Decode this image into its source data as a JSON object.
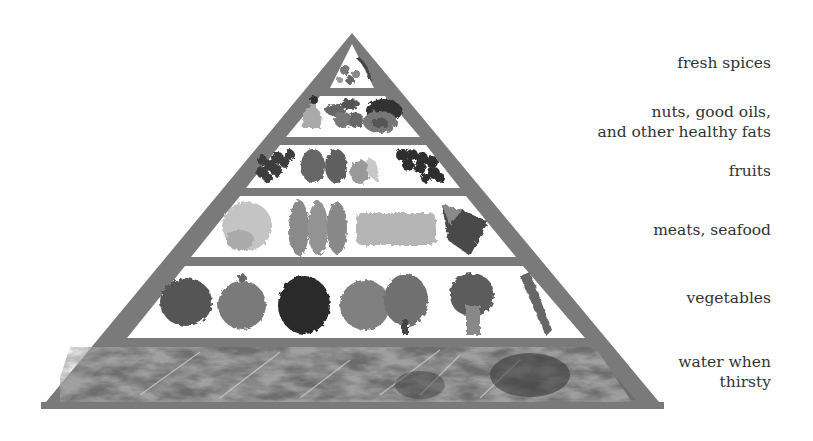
{
  "diagram": {
    "type": "food-pyramid",
    "colors": {
      "frame": "#777777",
      "tier_bg": "#ffffff",
      "text": "#333333"
    },
    "tiers": [
      {
        "level": 1,
        "label": "fresh spices",
        "items": [
          "herbs",
          "spices",
          "chili peppers"
        ]
      },
      {
        "level": 2,
        "label": "nuts, good oils, and other healthy fats",
        "label_lines": [
          "nuts, good oils,",
          "and other healthy fats"
        ],
        "items": [
          "oil bottle",
          "nuts",
          "avocado"
        ]
      },
      {
        "level": 3,
        "label": "fruits",
        "items": [
          "grapes",
          "strawberries",
          "melon and banana",
          "grapes"
        ]
      },
      {
        "level": 4,
        "label": "meats, seafood",
        "items": [
          "poultry",
          "fish fillets",
          "meat slab",
          "steak"
        ]
      },
      {
        "level": 5,
        "label": "vegetables",
        "items": [
          "lettuce",
          "onion",
          "cabbage",
          "artichoke",
          "artichoke",
          "broccoli",
          "celery"
        ]
      },
      {
        "level": 6,
        "label": "water when thirsty",
        "label_lines": [
          "water when",
          "thirsty"
        ],
        "items": [
          "water texture"
        ]
      }
    ]
  }
}
